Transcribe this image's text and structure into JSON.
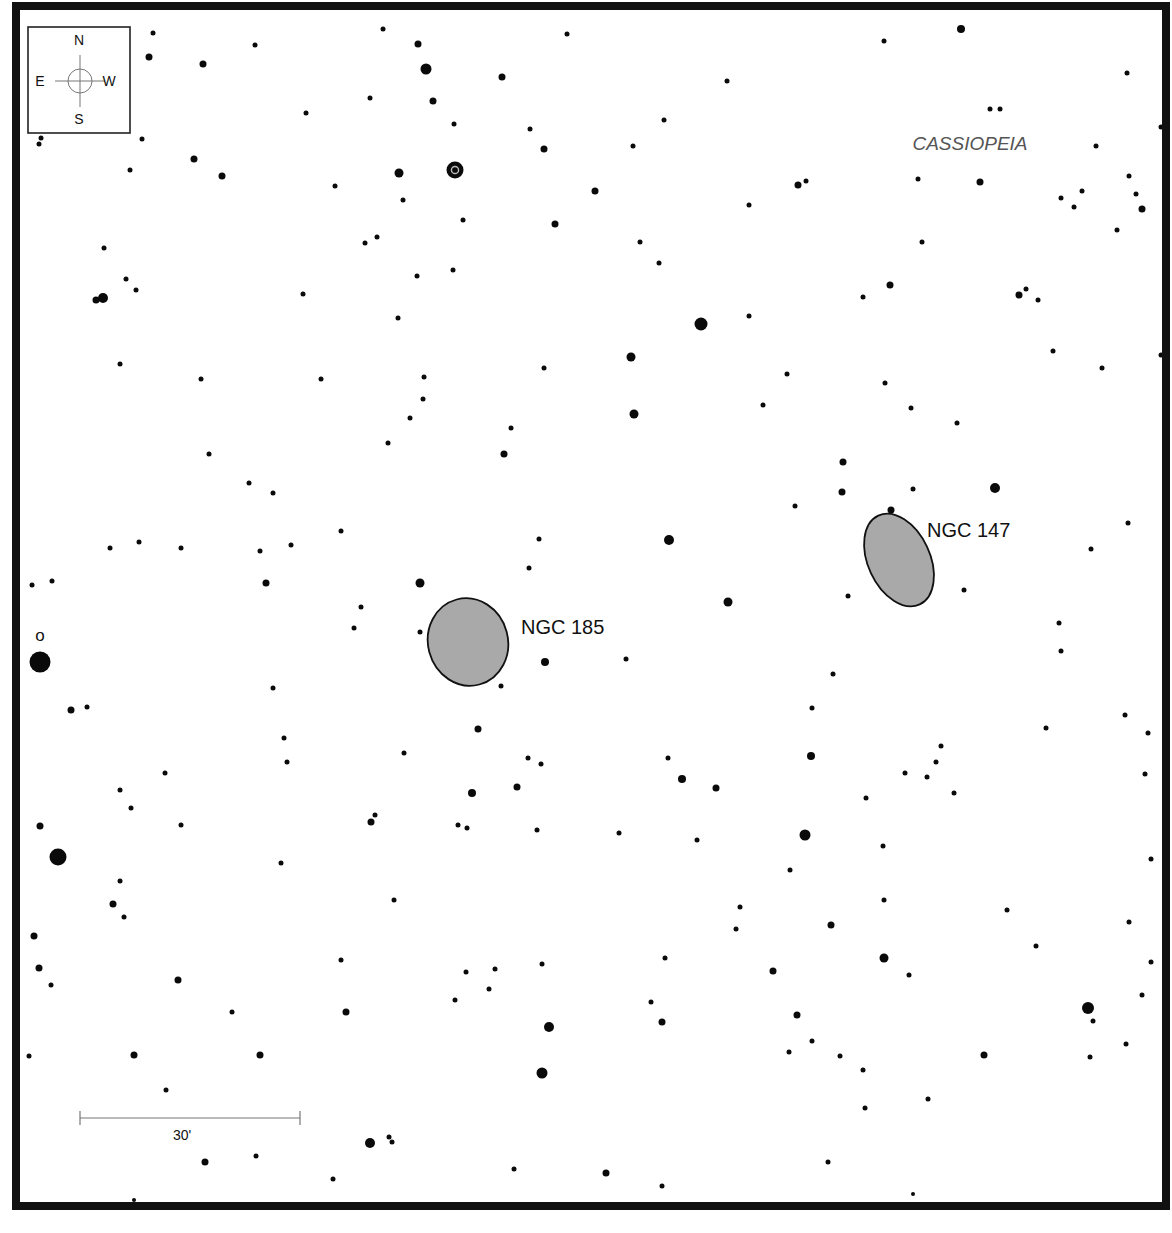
{
  "chart": {
    "frame": {
      "x": 16,
      "y": 6,
      "width": 1150,
      "height": 1200,
      "stroke": "#111111",
      "stroke_width": 8
    },
    "constellation_label": {
      "text": "CASSIOPEIA",
      "x": 970,
      "y": 150
    },
    "compass": {
      "box": {
        "x": 28,
        "y": 27,
        "w": 102,
        "h": 106
      },
      "north": "N",
      "south": "S",
      "east": "E",
      "west": "W"
    },
    "scale_bar": {
      "x1": 80,
      "x2": 300,
      "y": 1118,
      "label": "30'"
    },
    "galaxies": [
      {
        "name": "NGC 185",
        "cx": 468,
        "cy": 642,
        "rx": 40,
        "ry": 44,
        "rotate": -15,
        "label_x": 521,
        "label_y": 634,
        "fill": "#a9a9a9"
      },
      {
        "name": "NGC 147",
        "cx": 899,
        "cy": 560,
        "rx": 31,
        "ry": 49,
        "rotate": -25,
        "label_x": 927,
        "label_y": 537,
        "fill": "#a9a9a9"
      }
    ],
    "star_labels": [
      {
        "text": "o",
        "x": 40,
        "y": 641
      }
    ],
    "variable_stars": [
      {
        "x": 455,
        "y": 170,
        "r": 8.5
      }
    ],
    "stars": [
      [
        153,
        33,
        2.5
      ],
      [
        255,
        45,
        2.5
      ],
      [
        383,
        29,
        2.5
      ],
      [
        418,
        44,
        3.5
      ],
      [
        567,
        34,
        2.5
      ],
      [
        668,
        6,
        2.5
      ],
      [
        884,
        41,
        2.5
      ],
      [
        961,
        29,
        4
      ],
      [
        149,
        57,
        3.5
      ],
      [
        203,
        64,
        3.5
      ],
      [
        426,
        69,
        5.5
      ],
      [
        502,
        77,
        3.5
      ],
      [
        727,
        81,
        2.5
      ],
      [
        1127,
        73,
        2.5
      ],
      [
        370,
        98,
        2.5
      ],
      [
        433,
        101,
        3.5
      ],
      [
        306,
        113,
        2.5
      ],
      [
        664,
        120,
        2.5
      ],
      [
        990,
        109,
        2.5
      ],
      [
        1000,
        109,
        2.5
      ],
      [
        41,
        138,
        2.5
      ],
      [
        39,
        144,
        2.5
      ],
      [
        142,
        139,
        2.5
      ],
      [
        454,
        124,
        2.5
      ],
      [
        530,
        129,
        2.5
      ],
      [
        544,
        149,
        3.5
      ],
      [
        633,
        146,
        2.5
      ],
      [
        1161,
        127,
        2.5
      ],
      [
        1096,
        146,
        2.5
      ],
      [
        194,
        159,
        3.5
      ],
      [
        222,
        176,
        3.5
      ],
      [
        130,
        170,
        2.5
      ],
      [
        399,
        173,
        4.5
      ],
      [
        335,
        186,
        2.5
      ],
      [
        595,
        191,
        3.5
      ],
      [
        798,
        185,
        3.5
      ],
      [
        806,
        181,
        2.5
      ],
      [
        918,
        179,
        2.5
      ],
      [
        980,
        182,
        3.5
      ],
      [
        1129,
        176,
        2.5
      ],
      [
        403,
        200,
        2.5
      ],
      [
        463,
        220,
        2.5
      ],
      [
        555,
        224,
        3.5
      ],
      [
        749,
        205,
        2.5
      ],
      [
        1061,
        198,
        2.5
      ],
      [
        1082,
        191,
        2.5
      ],
      [
        1074,
        207,
        2.5
      ],
      [
        1136,
        194,
        2.5
      ],
      [
        1142,
        209,
        3.5
      ],
      [
        1117,
        230,
        2.5
      ],
      [
        104,
        248,
        2.5
      ],
      [
        365,
        243,
        2.5
      ],
      [
        377,
        237,
        2.5
      ],
      [
        640,
        242,
        2.5
      ],
      [
        659,
        263,
        2.5
      ],
      [
        922,
        242,
        2.5
      ],
      [
        126,
        279,
        2.5
      ],
      [
        136,
        290,
        2.5
      ],
      [
        417,
        276,
        2.5
      ],
      [
        453,
        270,
        2.5
      ],
      [
        303,
        294,
        2.5
      ],
      [
        863,
        297,
        2.5
      ],
      [
        890,
        285,
        3.5
      ],
      [
        1019,
        295,
        3.5
      ],
      [
        1026,
        289,
        2.5
      ],
      [
        1038,
        300,
        2.5
      ],
      [
        96,
        300,
        3.5
      ],
      [
        103,
        298,
        5
      ],
      [
        398,
        318,
        2.5
      ],
      [
        701,
        324,
        6.5
      ],
      [
        749,
        316,
        2.5
      ],
      [
        120,
        364,
        2.5
      ],
      [
        631,
        357,
        4.5
      ],
      [
        544,
        368,
        2.5
      ],
      [
        1053,
        351,
        2.5
      ],
      [
        1102,
        368,
        2.5
      ],
      [
        1161,
        355,
        2.5
      ],
      [
        201,
        379,
        2.5
      ],
      [
        321,
        379,
        2.5
      ],
      [
        424,
        377,
        2.5
      ],
      [
        423,
        399,
        2.5
      ],
      [
        787,
        374,
        2.5
      ],
      [
        885,
        383,
        2.5
      ],
      [
        410,
        418,
        2.5
      ],
      [
        634,
        414,
        4.5
      ],
      [
        763,
        405,
        2.5
      ],
      [
        911,
        408,
        2.5
      ],
      [
        388,
        443,
        2.5
      ],
      [
        511,
        428,
        2.5
      ],
      [
        504,
        454,
        3.5
      ],
      [
        957,
        423,
        2.5
      ],
      [
        209,
        454,
        2.5
      ],
      [
        249,
        483,
        2.5
      ],
      [
        273,
        493,
        2.5
      ],
      [
        843,
        462,
        3.5
      ],
      [
        842,
        492,
        3.5
      ],
      [
        795,
        506,
        2.5
      ],
      [
        913,
        489,
        2.5
      ],
      [
        995,
        488,
        5
      ],
      [
        891,
        510,
        3.5
      ],
      [
        110,
        548,
        2.5
      ],
      [
        139,
        542,
        2.5
      ],
      [
        181,
        548,
        2.5
      ],
      [
        260,
        551,
        2.5
      ],
      [
        291,
        545,
        2.5
      ],
      [
        341,
        531,
        2.5
      ],
      [
        539,
        539,
        2.5
      ],
      [
        669,
        540,
        5
      ],
      [
        1128,
        523,
        2.5
      ],
      [
        1091,
        549,
        2.5
      ],
      [
        32,
        585,
        2.5
      ],
      [
        52,
        581,
        2.5
      ],
      [
        266,
        583,
        3.5
      ],
      [
        420,
        583,
        4.5
      ],
      [
        529,
        568,
        2.5
      ],
      [
        361,
        607,
        2.5
      ],
      [
        354,
        628,
        2.5
      ],
      [
        420,
        632,
        2.5
      ],
      [
        728,
        602,
        4.5
      ],
      [
        848,
        596,
        2.5
      ],
      [
        964,
        590,
        2.5
      ],
      [
        1059,
        623,
        2.5
      ],
      [
        545,
        662,
        4
      ],
      [
        626,
        659,
        2.5
      ],
      [
        501,
        686,
        2.5
      ],
      [
        833,
        674,
        2.5
      ],
      [
        1061,
        651,
        2.5
      ],
      [
        40,
        662,
        10.5
      ],
      [
        71,
        710,
        3.5
      ],
      [
        87,
        707,
        2.5
      ],
      [
        273,
        688,
        2.5
      ],
      [
        478,
        729,
        3.5
      ],
      [
        812,
        708,
        2.5
      ],
      [
        1046,
        728,
        2.5
      ],
      [
        1125,
        715,
        2.5
      ],
      [
        1148,
        733,
        2.5
      ],
      [
        284,
        738,
        2.5
      ],
      [
        287,
        762,
        2.5
      ],
      [
        404,
        753,
        2.5
      ],
      [
        528,
        758,
        2.5
      ],
      [
        541,
        764,
        2.5
      ],
      [
        668,
        758,
        2.5
      ],
      [
        682,
        779,
        4
      ],
      [
        716,
        788,
        3.5
      ],
      [
        811,
        756,
        4
      ],
      [
        941,
        746,
        2.5
      ],
      [
        936,
        762,
        2.5
      ],
      [
        927,
        777,
        2.5
      ],
      [
        905,
        773,
        2.5
      ],
      [
        954,
        793,
        2.5
      ],
      [
        1145,
        774,
        2.5
      ],
      [
        165,
        773,
        2.5
      ],
      [
        120,
        790,
        2.5
      ],
      [
        131,
        808,
        2.5
      ],
      [
        472,
        793,
        4
      ],
      [
        517,
        787,
        3.5
      ],
      [
        866,
        798,
        2.5
      ],
      [
        40,
        826,
        3.5
      ],
      [
        181,
        825,
        2.5
      ],
      [
        371,
        822,
        3.5
      ],
      [
        375,
        815,
        2.5
      ],
      [
        458,
        825,
        2.5
      ],
      [
        467,
        828,
        2.5
      ],
      [
        537,
        830,
        2.5
      ],
      [
        619,
        833,
        2.5
      ],
      [
        697,
        840,
        2.5
      ],
      [
        805,
        835,
        5.5
      ],
      [
        883,
        846,
        2.5
      ],
      [
        1151,
        859,
        2.5
      ],
      [
        58,
        857,
        8.5
      ],
      [
        281,
        863,
        2.5
      ],
      [
        790,
        870,
        2.5
      ],
      [
        120,
        881,
        2.5
      ],
      [
        113,
        904,
        3.5
      ],
      [
        124,
        917,
        2.5
      ],
      [
        394,
        900,
        2.5
      ],
      [
        740,
        907,
        2.5
      ],
      [
        736,
        929,
        2.5
      ],
      [
        831,
        925,
        3.5
      ],
      [
        884,
        900,
        2.5
      ],
      [
        1007,
        910,
        2.5
      ],
      [
        1129,
        922,
        2.5
      ],
      [
        34,
        936,
        3.5
      ],
      [
        1036,
        946,
        2.5
      ],
      [
        39,
        968,
        3.5
      ],
      [
        51,
        985,
        2.5
      ],
      [
        178,
        980,
        3.5
      ],
      [
        341,
        960,
        2.5
      ],
      [
        466,
        972,
        2.5
      ],
      [
        495,
        969,
        2.5
      ],
      [
        489,
        989,
        2.5
      ],
      [
        542,
        964,
        2.5
      ],
      [
        665,
        958,
        2.5
      ],
      [
        773,
        971,
        3.5
      ],
      [
        884,
        958,
        4.5
      ],
      [
        909,
        975,
        2.5
      ],
      [
        1151,
        962,
        2.5
      ],
      [
        455,
        1000,
        2.5
      ],
      [
        651,
        1002,
        2.5
      ],
      [
        662,
        1022,
        3.5
      ],
      [
        549,
        1027,
        5
      ],
      [
        346,
        1012,
        3.5
      ],
      [
        232,
        1012,
        2.5
      ],
      [
        797,
        1015,
        3.5
      ],
      [
        1088,
        1008,
        6
      ],
      [
        1093,
        1021,
        2.5
      ],
      [
        1142,
        995,
        2.5
      ],
      [
        29,
        1056,
        2.5
      ],
      [
        134,
        1055,
        3.5
      ],
      [
        260,
        1055,
        3.5
      ],
      [
        542,
        1073,
        5.5
      ],
      [
        789,
        1052,
        2.5
      ],
      [
        812,
        1041,
        2.5
      ],
      [
        840,
        1056,
        2.5
      ],
      [
        863,
        1070,
        2.5
      ],
      [
        984,
        1055,
        3.5
      ],
      [
        1090,
        1057,
        2.5
      ],
      [
        1126,
        1044,
        2.5
      ],
      [
        166,
        1090,
        2.5
      ],
      [
        928,
        1099,
        2.5
      ],
      [
        865,
        1108,
        2.5
      ],
      [
        370,
        1143,
        5
      ],
      [
        389,
        1137,
        2.5
      ],
      [
        392,
        1142,
        2.5
      ],
      [
        205,
        1162,
        3.5
      ],
      [
        256,
        1156,
        2.5
      ],
      [
        333,
        1179,
        2.5
      ],
      [
        514,
        1169,
        2.5
      ],
      [
        606,
        1173,
        3.5
      ],
      [
        662,
        1186,
        2.5
      ],
      [
        828,
        1162,
        2.5
      ],
      [
        134,
        1200,
        2
      ],
      [
        913,
        1194,
        2
      ]
    ]
  }
}
